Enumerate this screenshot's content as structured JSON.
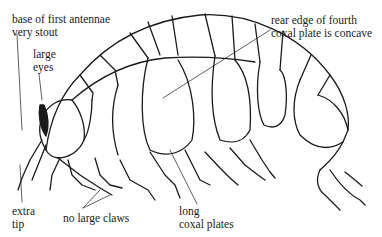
{
  "diagram": {
    "stroke_color": "#1a1a1a",
    "background": "#ffffff",
    "labels": {
      "antennae": [
        "base of first antennae",
        "very stout"
      ],
      "eyes": [
        "large",
        "eyes"
      ],
      "rear_edge": [
        "rear edge of fourth",
        "coxal plate is concave"
      ],
      "extra_tip": [
        "extra",
        "tip"
      ],
      "no_claws": [
        "no large claws"
      ],
      "coxal_plates": [
        "long",
        "coxal plates"
      ]
    }
  }
}
